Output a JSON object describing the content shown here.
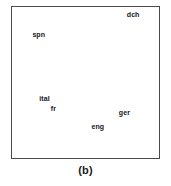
{
  "figure": {
    "caption": "(b)",
    "frame": {
      "border_color": "#4a4a4a",
      "background_color": "#ffffff"
    },
    "label_color": "#16161a"
  },
  "chart_data": {
    "type": "scatter",
    "title": "",
    "subtitle": "",
    "xlabel": "",
    "ylabel": "",
    "xlim": [
      0,
      1
    ],
    "ylim": [
      0,
      1
    ],
    "xticks": [],
    "yticks": [],
    "grid": false,
    "legend": false,
    "axis_visible": false,
    "frame_visible": true,
    "markers_visible": false,
    "annotation_only": true,
    "points": [
      {
        "label": "dch",
        "x": 0.824,
        "y": 0.944
      },
      {
        "label": "spn",
        "x": 0.182,
        "y": 0.817
      },
      {
        "label": "ital",
        "x": 0.221,
        "y": 0.392
      },
      {
        "label": "fr",
        "x": 0.282,
        "y": 0.327
      },
      {
        "label": "ger",
        "x": 0.765,
        "y": 0.301
      },
      {
        "label": "eng",
        "x": 0.584,
        "y": 0.203
      }
    ]
  }
}
